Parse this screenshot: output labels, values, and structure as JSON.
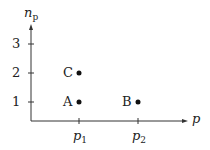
{
  "diagram": {
    "x_axis": {
      "label": "p",
      "ticks": [
        {
          "label": "p",
          "sub": "1"
        },
        {
          "label": "p",
          "sub": "2"
        }
      ]
    },
    "y_axis": {
      "label": "n",
      "label_sub": "p",
      "ticks": [
        "1",
        "2",
        "3"
      ]
    },
    "points": [
      {
        "name": "A",
        "x": "p1",
        "y": 1
      },
      {
        "name": "B",
        "x": "p2",
        "y": 1
      },
      {
        "name": "C",
        "x": "p1",
        "y": 2
      }
    ],
    "color": "#222222"
  }
}
